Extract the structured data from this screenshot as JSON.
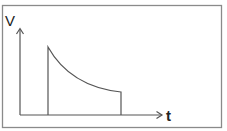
{
  "diagram": {
    "type": "voltage-time pulse with exponential decay",
    "y_axis_label": "V",
    "x_axis_label": "t",
    "colors": {
      "stroke": "#555555",
      "frame": "#8a8a8a",
      "text": "#222222",
      "background": "#ffffff"
    }
  }
}
